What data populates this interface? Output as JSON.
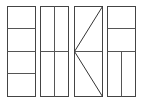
{
  "canvas": {
    "width": 145,
    "height": 102,
    "background": "#ffffff"
  },
  "style": {
    "stroke": "#444444"
  },
  "panels": [
    {
      "id": "panel-1",
      "description": "rectangle divided into four horizontal sections",
      "rect": {
        "x": 7.5,
        "y": 6.5,
        "w": 28,
        "h": 90
      },
      "lines": [
        {
          "x1": 7.5,
          "y1": 28.5,
          "x2": 35.5,
          "y2": 28.5
        },
        {
          "x1": 7.5,
          "y1": 51.5,
          "x2": 35.5,
          "y2": 51.5
        },
        {
          "x1": 7.5,
          "y1": 73.5,
          "x2": 35.5,
          "y2": 73.5
        }
      ]
    },
    {
      "id": "panel-2",
      "description": "rectangle divided into four quadrants by one vertical and one horizontal line",
      "rect": {
        "x": 40.5,
        "y": 6.5,
        "w": 28,
        "h": 90
      },
      "lines": [
        {
          "x1": 54.5,
          "y1": 6.5,
          "x2": 54.5,
          "y2": 96.5
        },
        {
          "x1": 40.5,
          "y1": 51.5,
          "x2": 68.5,
          "y2": 51.5
        }
      ]
    },
    {
      "id": "panel-3",
      "description": "rectangle with two diagonals from right corners meeting at left midpoint, plus horizontal midline",
      "rect": {
        "x": 74.5,
        "y": 6.5,
        "w": 28,
        "h": 90
      },
      "lines": [
        {
          "x1": 102.5,
          "y1": 6.5,
          "x2": 74.5,
          "y2": 51.5
        },
        {
          "x1": 74.5,
          "y1": 51.5,
          "x2": 102.5,
          "y2": 96.5
        },
        {
          "x1": 74.5,
          "y1": 51.5,
          "x2": 102.5,
          "y2": 51.5
        }
      ]
    },
    {
      "id": "panel-4",
      "description": "rectangle with two upper horizontal sections and lower half split vertically",
      "rect": {
        "x": 107.5,
        "y": 6.5,
        "w": 28,
        "h": 90
      },
      "lines": [
        {
          "x1": 107.5,
          "y1": 28.5,
          "x2": 135.5,
          "y2": 28.5
        },
        {
          "x1": 107.5,
          "y1": 51.5,
          "x2": 135.5,
          "y2": 51.5
        },
        {
          "x1": 121.5,
          "y1": 51.5,
          "x2": 121.5,
          "y2": 96.5
        }
      ]
    }
  ]
}
